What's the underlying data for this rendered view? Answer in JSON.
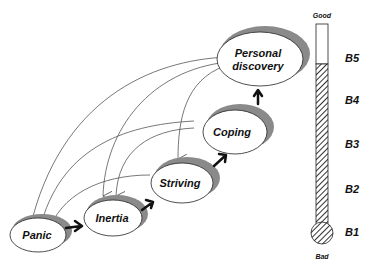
{
  "diagram": {
    "stages": [
      {
        "id": "panic",
        "label": "Panic"
      },
      {
        "id": "inertia",
        "label": "Inertia"
      },
      {
        "id": "striving",
        "label": "Striving"
      },
      {
        "id": "coping",
        "label": "Coping"
      },
      {
        "id": "personal_discovery",
        "label_line1": "Personal",
        "label_line2": "discovery"
      }
    ],
    "forward_arrows": [
      "panic->inertia",
      "inertia->striving",
      "striving->coping",
      "coping->personal_discovery"
    ],
    "feedback_arrows": [
      "personal_discovery->panic",
      "personal_discovery->inertia",
      "personal_discovery->striving",
      "coping->panic",
      "coping->inertia",
      "striving->panic"
    ]
  },
  "scale": {
    "top_label": "Good",
    "bottom_label": "Bad",
    "levels": [
      "B5",
      "B4",
      "B3",
      "B2",
      "B1"
    ]
  },
  "colors": {
    "ellipse_fill": "#ffffff",
    "shadow": "#8a8a8a",
    "stroke": "#222222",
    "hatch": "#333333"
  }
}
